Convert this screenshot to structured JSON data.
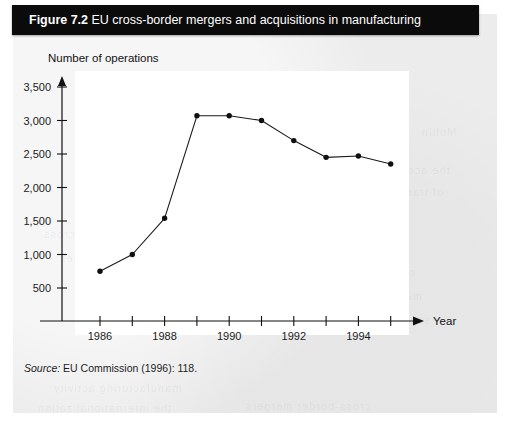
{
  "figure": {
    "label": "Figure 7.2",
    "caption": "EU cross-border mergers and acquisitions in manufacturing",
    "source_word": "Source:",
    "source_text": " EU Commission (1996): 118."
  },
  "colors": {
    "title_bar_bg": "#0b0b0b",
    "title_text": "#ffffff",
    "panel_bg": "#ececed",
    "plot_bg": "#ffffff",
    "ink": "#111111",
    "series": "#1a1a1a"
  },
  "ghost_text": [
    {
      "text": "Multin",
      "x": 408,
      "y": 112
    },
    {
      "text": "the accou",
      "x": 380,
      "y": 150
    },
    {
      "text": "of tran",
      "x": 392,
      "y": 172
    },
    {
      "text": "net cross",
      "x": 30,
      "y": 214
    },
    {
      "text": "inves",
      "x": 46,
      "y": 238
    },
    {
      "text": "consider the",
      "x": 330,
      "y": 252
    },
    {
      "text": "measured",
      "x": 352,
      "y": 276
    },
    {
      "text": "sector has",
      "x": 356,
      "y": 300
    },
    {
      "text": "manufacturing activity",
      "x": 40,
      "y": 368
    },
    {
      "text": "the internationalization",
      "x": 24,
      "y": 388
    },
    {
      "text": "cross-border mergers",
      "x": 232,
      "y": 386
    }
  ],
  "chart_data": {
    "type": "line",
    "title": "EU cross-border mergers and acquisitions in manufacturing",
    "xlabel": "Year",
    "ylabel": "Number of operations",
    "x": [
      1986,
      1987,
      1988,
      1989,
      1990,
      1991,
      1992,
      1993,
      1994,
      1995
    ],
    "values": [
      750,
      1000,
      1540,
      3070,
      3070,
      3000,
      2700,
      2450,
      2470,
      2350
    ],
    "xtick_values": [
      1986,
      1987,
      1988,
      1989,
      1990,
      1991,
      1992,
      1993,
      1994,
      1995
    ],
    "xtick_labels": [
      "1986",
      "",
      "1988",
      "",
      "1990",
      "",
      "1992",
      "",
      "1994",
      ""
    ],
    "ytick_values": [
      500,
      1000,
      1500,
      2000,
      2500,
      3000,
      3500
    ],
    "ytick_labels": [
      "500",
      "1,000",
      "1,500",
      "2,000",
      "2,500",
      "3,000",
      "3,500"
    ],
    "xlim": [
      1985.4,
      1995.6
    ],
    "ylim": [
      0,
      3700
    ],
    "grid": false,
    "legend": false,
    "marker": "filled-circle",
    "axis_arrows": true
  }
}
